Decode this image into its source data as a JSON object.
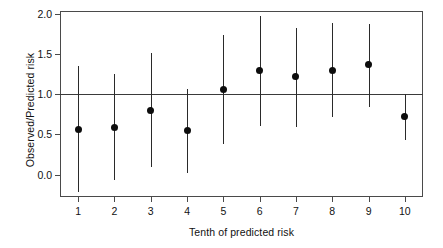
{
  "chart_data": {
    "type": "scatter",
    "title": "",
    "xlabel": "Tenth of predicted risk",
    "ylabel": "Observed/Predicted risk",
    "categories": [
      "1",
      "2",
      "3",
      "4",
      "5",
      "6",
      "7",
      "8",
      "9",
      "10"
    ],
    "x": [
      1,
      2,
      3,
      4,
      5,
      6,
      7,
      8,
      9,
      10
    ],
    "values": [
      0.56,
      0.59,
      0.8,
      0.55,
      1.06,
      1.3,
      1.22,
      1.3,
      1.37,
      0.73
    ],
    "ci_lower": [
      -0.22,
      -0.07,
      0.1,
      0.02,
      0.38,
      0.6,
      0.59,
      0.72,
      0.84,
      0.43
    ],
    "ci_upper": [
      1.35,
      1.26,
      1.51,
      1.07,
      1.74,
      1.98,
      1.83,
      1.89,
      1.88,
      1.01
    ],
    "reference_line": 1.0,
    "ylim": [
      -0.28,
      2.04
    ],
    "xlim": [
      0.5,
      10.5
    ],
    "yticks": [
      0.0,
      0.5,
      1.0,
      1.5,
      2.0
    ],
    "ytick_labels": [
      "0.0",
      "0.5",
      "1.0",
      "1.5",
      "2.0"
    ],
    "xticks": [
      1,
      2,
      3,
      4,
      5,
      6,
      7,
      8,
      9,
      10
    ],
    "xtick_labels": [
      "1",
      "2",
      "3",
      "4",
      "5",
      "6",
      "7",
      "8",
      "9",
      "10"
    ],
    "grid": false,
    "legend": null,
    "series_name": "Observed/Predicted risk",
    "marker": "filled-circle",
    "errorbar_style": "vertical-line",
    "colors": {
      "point": "#0d0d0d",
      "errorbar": "#2a2a2a",
      "axis": "#4a4a4a",
      "reference_line": "#3a3a3a",
      "background": "#ffffff",
      "text": "#111111"
    }
  }
}
